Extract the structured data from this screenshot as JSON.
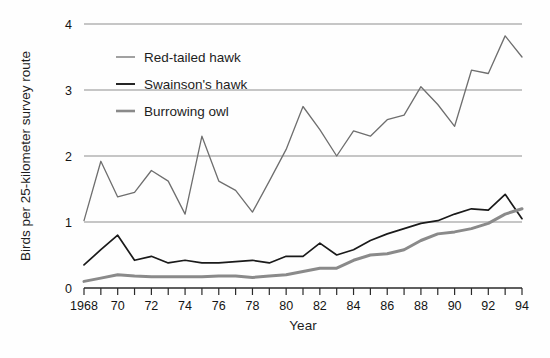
{
  "chart_data": {
    "type": "line",
    "title": "",
    "xlabel": "Year",
    "ylabel": "Birds per 25-kilometer survey route",
    "xlim": [
      1968,
      1994
    ],
    "ylim": [
      0,
      4
    ],
    "grid": true,
    "grid_axis": "y",
    "legend_position": "top-left-inside",
    "y_ticks": [
      "0",
      "1",
      "2",
      "3",
      "4"
    ],
    "y_tick_values": [
      0,
      1,
      2,
      3,
      4
    ],
    "x_tick_values": [
      1968,
      1969,
      1970,
      1971,
      1972,
      1973,
      1974,
      1975,
      1976,
      1977,
      1978,
      1979,
      1980,
      1981,
      1982,
      1983,
      1984,
      1985,
      1986,
      1987,
      1988,
      1989,
      1990,
      1991,
      1992,
      1993,
      1994
    ],
    "x_tick_labels": [
      "1968",
      "",
      "70",
      "",
      "72",
      "",
      "74",
      "",
      "76",
      "",
      "78",
      "",
      "80",
      "",
      "82",
      "",
      "84",
      "",
      "86",
      "",
      "88",
      "",
      "90",
      "",
      "92",
      "",
      "94"
    ],
    "x": [
      1968,
      1969,
      1970,
      1971,
      1972,
      1973,
      1974,
      1975,
      1976,
      1977,
      1978,
      1979,
      1980,
      1981,
      1982,
      1983,
      1984,
      1985,
      1986,
      1987,
      1988,
      1989,
      1990,
      1991,
      1992,
      1993,
      1994
    ],
    "series": [
      {
        "name": "Red-tailed hawk",
        "color": "#6e6e6e",
        "width": 1.3,
        "values": [
          1.02,
          1.92,
          1.38,
          1.45,
          1.78,
          1.62,
          1.12,
          2.3,
          1.62,
          1.48,
          1.15,
          1.62,
          2.1,
          2.75,
          2.4,
          2.0,
          2.38,
          2.3,
          2.55,
          2.62,
          3.05,
          2.78,
          2.45,
          3.3,
          3.25,
          3.82,
          3.5
        ]
      },
      {
        "name": "Swainson's hawk",
        "color": "#1a1a1a",
        "width": 1.7,
        "values": [
          0.35,
          0.58,
          0.8,
          0.42,
          0.48,
          0.38,
          0.42,
          0.38,
          0.38,
          0.4,
          0.42,
          0.38,
          0.48,
          0.48,
          0.68,
          0.5,
          0.58,
          0.72,
          0.82,
          0.9,
          0.98,
          1.02,
          1.12,
          1.2,
          1.18,
          1.42,
          1.05
        ]
      },
      {
        "name": "Burrowing owl",
        "color": "#8a8a8a",
        "width": 3.0,
        "values": [
          0.1,
          0.15,
          0.2,
          0.18,
          0.17,
          0.17,
          0.17,
          0.17,
          0.18,
          0.18,
          0.16,
          0.18,
          0.2,
          0.25,
          0.3,
          0.3,
          0.42,
          0.5,
          0.52,
          0.58,
          0.72,
          0.82,
          0.85,
          0.9,
          0.98,
          1.12,
          1.2
        ]
      }
    ],
    "legend": [
      {
        "label": "Red-tailed hawk",
        "color": "#6e6e6e",
        "width": 1.3
      },
      {
        "label": "Swainson's hawk",
        "color": "#1a1a1a",
        "width": 1.9
      },
      {
        "label": "Burrowing owl",
        "color": "#8a8a8a",
        "width": 2.6
      }
    ],
    "colors": {
      "axis": "#2a2a2a",
      "grid": "#8e8e8e",
      "background": "#fefefe",
      "text": "#1a1a1a"
    }
  }
}
